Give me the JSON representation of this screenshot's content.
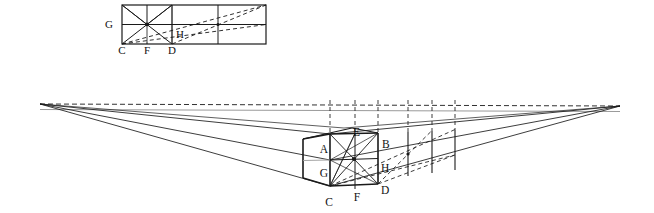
{
  "figure": {
    "type": "geometric-diagram",
    "background_color": "#ffffff",
    "line_color": "#1a1a1a",
    "faint_line_color": "#8a8a8a",
    "canvas": {
      "width": 654,
      "height": 213
    }
  },
  "top_diagram": {
    "name": "orthographic-elevation",
    "description": "Flat (non-perspective) elevation: a square with full X diagonals on the left, extended by three further rectangular bays to the right, crossed by long dashed diagonals.",
    "rect": {
      "x": 122,
      "y": 5,
      "width": 144,
      "height": 39
    },
    "vertical_divisions_x": [
      122,
      147,
      172,
      218,
      266
    ],
    "horizontal_division_y": 24.5,
    "labels": [
      {
        "id": "G",
        "text": "G",
        "x": 113,
        "y": 28,
        "anchor": "end"
      },
      {
        "id": "H",
        "text": "H",
        "x": 176,
        "y": 38,
        "anchor": "start"
      },
      {
        "id": "C",
        "text": "C",
        "x": 122,
        "y": 54,
        "anchor": "middle"
      },
      {
        "id": "F",
        "text": "F",
        "x": 147,
        "y": 54,
        "anchor": "middle"
      },
      {
        "id": "D",
        "text": "D",
        "x": 172,
        "y": 54,
        "anchor": "middle"
      }
    ]
  },
  "main_diagram": {
    "name": "two-point-perspective",
    "description": "Cube drawn in two-point perspective with left and right vanishing points on the horizon, plus a receding grid of bays to the right and dashed diagonals locating each new bay.",
    "vanishing_point_left": {
      "id": "VPL",
      "x": 40,
      "y": 104
    },
    "vanishing_point_right": {
      "id": "VPR",
      "x": 620,
      "y": 106
    },
    "horizon_line": {
      "y_left": 104,
      "y_right": 106,
      "style": "dashed"
    },
    "eye_level_line": {
      "y_left": 110,
      "y_right": 112,
      "style": "solid-faint"
    },
    "cube": {
      "front_vertical_x": 330,
      "right_vertical_x": 378,
      "mid_vertical_x": 355,
      "top_y_front": 134,
      "top_y_right": 133,
      "mid_y_front": 160,
      "bottom_y_front": 186,
      "back_top_y": 128,
      "back_offset_x": 14
    },
    "labels": [
      {
        "id": "E",
        "text": "E",
        "x": 353,
        "y": 135,
        "anchor": "start"
      },
      {
        "id": "A",
        "text": "A",
        "x": 327,
        "y": 152,
        "anchor": "end"
      },
      {
        "id": "B",
        "text": "B",
        "x": 382,
        "y": 147,
        "anchor": "start"
      },
      {
        "id": "G",
        "text": "G",
        "x": 327,
        "y": 176,
        "anchor": "end"
      },
      {
        "id": "H",
        "text": "H",
        "x": 381,
        "y": 171,
        "anchor": "start"
      },
      {
        "id": "C",
        "text": "C",
        "x": 329,
        "y": 205,
        "anchor": "middle"
      },
      {
        "id": "F",
        "text": "F",
        "x": 357,
        "y": 201,
        "anchor": "middle"
      },
      {
        "id": "D",
        "text": "D",
        "x": 381,
        "y": 193,
        "anchor": "start"
      }
    ],
    "receding_bay_verticals_x": [
      378,
      408,
      432,
      455
    ],
    "dashed_vertical_guides_x": [
      330,
      355,
      378,
      408,
      432,
      455
    ]
  }
}
